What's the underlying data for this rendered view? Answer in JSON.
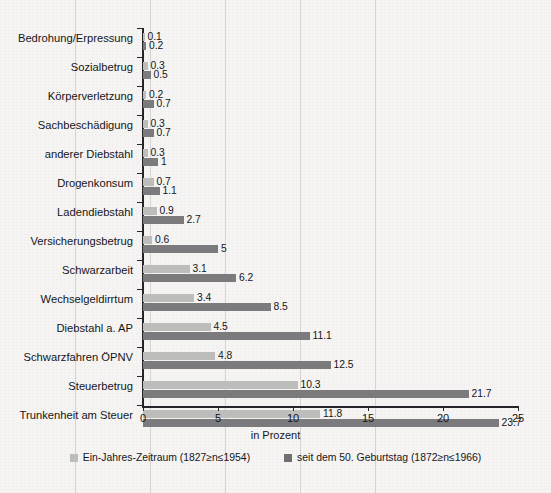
{
  "chart_data": {
    "type": "bar",
    "orientation": "horizontal",
    "title": "",
    "xlabel": "in Prozent",
    "ylabel": "",
    "xlim": [
      0,
      25
    ],
    "xticks": [
      0,
      5,
      10,
      15,
      20,
      25
    ],
    "xtick_labels": [
      "0",
      "5",
      "10",
      "15",
      "20",
      "25"
    ],
    "grid": true,
    "grid_axis": "x",
    "legend_position": "bottom",
    "categories": [
      "Bedrohung/Erpressung",
      "Sozialbetrug",
      "Körperverletzung",
      "Sachbeschädigung",
      "anderer Diebstahl",
      "Drogenkonsum",
      "Ladendiebstahl",
      "Versicherungsbetrug",
      "Schwarzarbeit",
      "Wechselgeldirrtum",
      "Diebstahl a. AP",
      "Schwarzfahren ÖPNV",
      "Steuerbetrug",
      "Trunkenheit am Steuer"
    ],
    "series": [
      {
        "name": "Ein-Jahres-Zeitraum (1827≥n≤1954)",
        "color": "#bdbdbc",
        "values": [
          0.1,
          0.3,
          0.2,
          0.3,
          0.3,
          0.7,
          0.9,
          0.6,
          3.1,
          3.4,
          4.5,
          4.8,
          10.3,
          11.8
        ],
        "value_labels": [
          "0.1",
          "0.3",
          "0.2",
          "0.3",
          "0.3",
          "0.7",
          "0.9",
          "0.6",
          "3.1",
          "3.4",
          "4.5",
          "4.8",
          "10.3",
          "11.8"
        ]
      },
      {
        "name": "seit dem 50. Geburtstag (1872≥n≤1966)",
        "color": "#7b7b7d",
        "values": [
          0.2,
          0.5,
          0.7,
          0.7,
          1,
          1.1,
          2.7,
          5,
          6.2,
          8.5,
          11.1,
          12.5,
          21.7,
          23.7
        ],
        "value_labels": [
          "0.2",
          "0.5",
          "0.7",
          "0.7",
          "1",
          "1.1",
          "2.7",
          "5",
          "6.2",
          "8.5",
          "11.1",
          "12.5",
          "21.7",
          "23.7"
        ]
      }
    ]
  }
}
